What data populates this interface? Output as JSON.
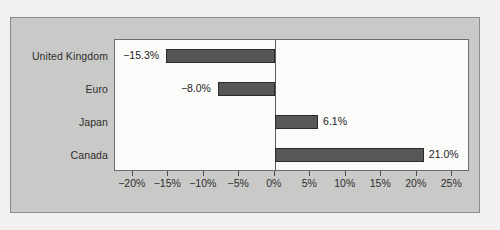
{
  "chart_data": {
    "type": "bar",
    "orientation": "horizontal",
    "title": "",
    "xlabel": "",
    "ylabel": "",
    "categories": [
      "United Kingdom",
      "Euro",
      "Japan",
      "Canada"
    ],
    "values": [
      -15.3,
      -8.0,
      6.1,
      21.0
    ],
    "value_labels": [
      "−15.3%",
      "−8.0%",
      "6.1%",
      "21.0%"
    ],
    "series": [
      {
        "name": "",
        "values": [
          -15.3,
          -8.0,
          6.1,
          21.0
        ]
      }
    ],
    "xlim": [
      -22.5,
      27.5
    ],
    "xticks": [
      -20,
      -15,
      -10,
      -5,
      0,
      5,
      10,
      15,
      20,
      25
    ],
    "xtick_labels": [
      "−20%",
      "−15%",
      "−10%",
      "−5%",
      "0%",
      "5%",
      "10%",
      "15%",
      "20%",
      "25%"
    ],
    "grid": false,
    "legend": false,
    "bar_color": "#57575a",
    "bar_edge_color": "#2b2b2d",
    "plot_background": "#fbfbfa",
    "chart_background": "#c9c9c7",
    "zero_line_color": "#5a5a58"
  }
}
